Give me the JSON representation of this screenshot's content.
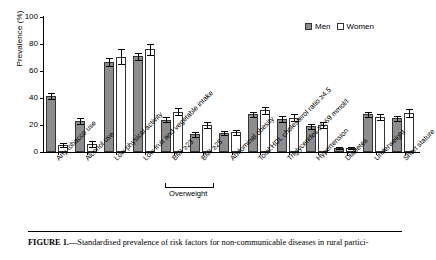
{
  "figure": {
    "caption_prefix": "FIGURE 1.",
    "caption_text": "—Standardised prevalence of risk factors for non-communicable diseases in rural partici-"
  },
  "legend": {
    "position": "top-right",
    "entries": [
      {
        "label": "Men",
        "color": "#8d8d8d"
      },
      {
        "label": "Women",
        "color": "#ffffff"
      }
    ]
  },
  "axis": {
    "ylabel": "Prevalence (%)",
    "yticks": [
      "0",
      "20",
      "40",
      "60",
      "80",
      "100"
    ]
  },
  "bracket": {
    "label": "Overweight",
    "spans": [
      "BMI ≥23",
      "BMI ≥25"
    ]
  },
  "chart_data": {
    "type": "bar",
    "title": "",
    "xlabel": "",
    "ylabel": "Prevalence (%)",
    "ylim": [
      0,
      100
    ],
    "grid": false,
    "legend_position": "top-right",
    "categories": [
      "Any tobacco use",
      "Alcohol use",
      "Low physical activity",
      "Low fruit and vegetable intake",
      "BMI ≥23",
      "BMI ≥25",
      "Abdominal obesity",
      "Total:HDL cholesterol ratio ≥4.5",
      "Triglycerides ≥1.69 mmol/l",
      "Hypertension",
      "Diabetes",
      "Underweight",
      "Short stature"
    ],
    "series": [
      {
        "name": "Men",
        "values": [
          41.5,
          23.0,
          67.0,
          71.0,
          24.0,
          13.0,
          14.0,
          28.0,
          24.5,
          19.0,
          3.0,
          28.0,
          25.0
        ],
        "err_low": [
          2.5,
          2.0,
          3.0,
          2.5,
          2.0,
          2.0,
          1.5,
          2.0,
          2.0,
          2.0,
          1.0,
          2.0,
          2.0
        ],
        "err_high": [
          2.5,
          2.0,
          3.0,
          2.5,
          2.0,
          2.0,
          1.5,
          2.0,
          2.0,
          2.0,
          1.0,
          2.0,
          2.0
        ]
      },
      {
        "name": "Women",
        "values": [
          5.0,
          6.0,
          70.5,
          76.0,
          30.0,
          20.0,
          14.5,
          31.0,
          25.5,
          20.0,
          3.0,
          26.0,
          29.0
        ],
        "err_low": [
          1.5,
          2.5,
          5.5,
          4.0,
          2.5,
          2.5,
          2.0,
          2.5,
          2.5,
          2.0,
          1.0,
          2.5,
          3.0
        ],
        "err_high": [
          1.5,
          2.5,
          5.5,
          4.0,
          2.5,
          2.5,
          2.0,
          2.5,
          2.5,
          2.0,
          1.0,
          2.5,
          3.0
        ]
      }
    ]
  }
}
